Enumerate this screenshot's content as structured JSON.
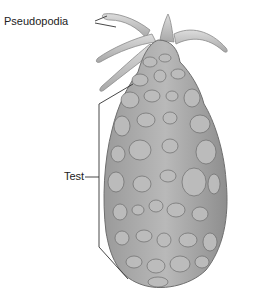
{
  "diagram": {
    "labels": {
      "pseudopodia": "Pseudopodia",
      "test": "Test"
    },
    "colors": {
      "background": "#ffffff",
      "body": "#a9a9a9",
      "body_dark": "#7d7d7d",
      "stone_fill": "#b8b8b8",
      "stone_stroke": "#6a6a6a",
      "pseudopod": "#c4c4c4",
      "leader_line": "#333333"
    }
  }
}
